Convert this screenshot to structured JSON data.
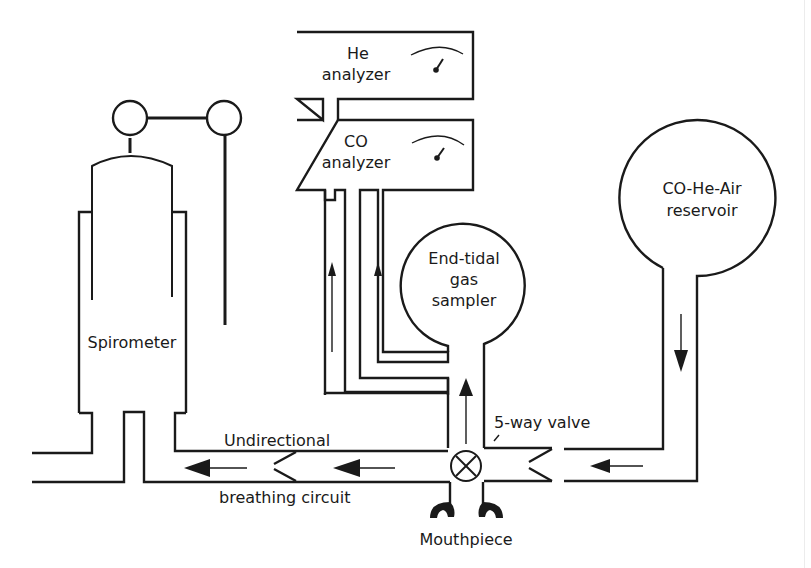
{
  "diagram": {
    "colors": {
      "line": "#1a1a1a",
      "background": "#ffffff"
    },
    "components": {
      "he_analyzer": {
        "line1": "He",
        "line2": "analyzer",
        "icon": "gauge-icon"
      },
      "co_analyzer": {
        "line1": "CO",
        "line2": "analyzer",
        "icon": "gauge-icon"
      },
      "spirometer": {
        "label": "Spirometer"
      },
      "end_tidal_sampler": {
        "line1": "End-tidal",
        "line2": "gas",
        "line3": "sampler"
      },
      "reservoir": {
        "line1": "CO-He-Air",
        "line2": "reservoir"
      },
      "valve": {
        "label": "5-way valve",
        "icon": "valve-cross-icon"
      },
      "mouthpiece": {
        "label": "Mouthpiece"
      },
      "circuit": {
        "line1": "Undirectional",
        "line2": "breathing circuit"
      }
    },
    "flow_arrows": [
      {
        "id": "sample-line-1",
        "direction": "up"
      },
      {
        "id": "sample-line-2",
        "direction": "up"
      },
      {
        "id": "valve-to-sampler",
        "direction": "up"
      },
      {
        "id": "reservoir-outflow",
        "direction": "down"
      },
      {
        "id": "circuit-right",
        "direction": "left"
      },
      {
        "id": "circuit-middle",
        "direction": "left"
      },
      {
        "id": "circuit-left",
        "direction": "left"
      }
    ]
  }
}
